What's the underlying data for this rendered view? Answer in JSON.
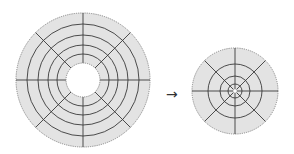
{
  "diagram": {
    "colors": {
      "disk_fill": "#e3e3e3",
      "outline": "#8a8a8a",
      "grid_lines": "#3a3a3a",
      "background": "#ffffff"
    },
    "left_disk": {
      "cx": 83,
      "cy": 80,
      "outer_radius": 67,
      "hole_radius": 17,
      "rings": [
        26,
        35,
        45,
        56
      ],
      "spokes": 8
    },
    "arrow": {
      "symbol": "→"
    },
    "right_disk": {
      "cx": 235,
      "cy": 91,
      "outer_radius": 43,
      "hole_radius": 2,
      "rings": [
        7,
        15,
        27
      ],
      "spokes": 8
    }
  }
}
